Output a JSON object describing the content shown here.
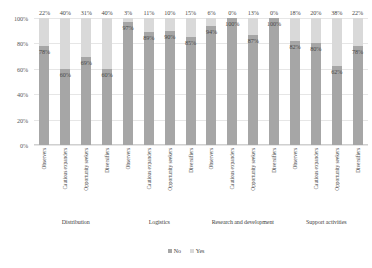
{
  "chart_data": {
    "type": "bar",
    "subtype": "stacked-bar-100pct",
    "title": "",
    "xlabel": "",
    "ylabel": "",
    "ylim": [
      0,
      100
    ],
    "grid": true,
    "legend_position": "bottom",
    "y_ticks": [
      "100%",
      "80%",
      "60%",
      "40%",
      "20%",
      "0%"
    ],
    "y_tick_values": [
      100,
      80,
      60,
      40,
      20,
      0
    ],
    "categories": [
      "Observers",
      "Cautious expanders",
      "Opportunity seekers",
      "Diversifiers",
      "Observers",
      "Cautious expanders",
      "Opportunity seekers",
      "Diversifiers",
      "Observers",
      "Cautious expanders",
      "Opportunity seekers",
      "Diversifiers",
      "Observers",
      "Cautious expanders",
      "Opportunity seekers",
      "Diversifiers"
    ],
    "groups": [
      {
        "label": "Distribution",
        "size": 4
      },
      {
        "label": "Logistics",
        "size": 4
      },
      {
        "label": "Research and development",
        "size": 4
      },
      {
        "label": "Support activities",
        "size": 4
      }
    ],
    "series": [
      {
        "name": "Yes",
        "color": "#a6a6a6",
        "values": [
          78,
          60,
          69,
          60,
          97,
          89,
          90,
          85,
          94,
          100,
          87,
          100,
          82,
          80,
          62,
          78
        ],
        "labels": [
          "78%",
          "60%",
          "69%",
          "60%",
          "97%",
          "89%",
          "90%",
          "85%",
          "94%",
          "100%",
          "87%",
          "100%",
          "82%",
          "80%",
          "62%",
          "78%"
        ]
      },
      {
        "name": "No",
        "color": "#d9d9d9",
        "values": [
          22,
          40,
          31,
          40,
          3,
          11,
          10,
          15,
          6,
          0,
          13,
          0,
          18,
          20,
          38,
          22
        ],
        "labels": [
          "22%",
          "40%",
          "31%",
          "40%",
          "3%",
          "11%",
          "10%",
          "15%",
          "6%",
          "0%",
          "13%",
          "0%",
          "18%",
          "20%",
          "38%",
          "22%"
        ]
      }
    ],
    "legend": [
      {
        "label": "No",
        "color": "#a6a6a6"
      },
      {
        "label": "Yes",
        "color": "#d9d9d9"
      }
    ]
  }
}
